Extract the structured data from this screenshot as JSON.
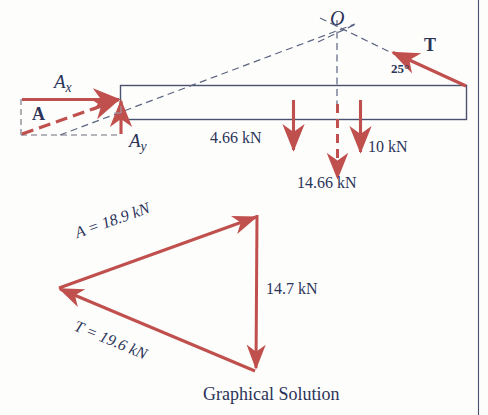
{
  "figure": {
    "caption": "Graphical Solution",
    "colors": {
      "force_red": "#c0504d",
      "ink_navy": "#2b3458",
      "beam_outline": "#4a5270",
      "construction_dash": "#5a6382",
      "page_rule": "#2b3458",
      "background": "#fdfdfc"
    }
  },
  "free_body_diagram": {
    "point_o_label": "O",
    "tension_label": "T",
    "tension_angle_label": "25°",
    "reaction_resultant_label": "A",
    "reaction_x_label": "A",
    "reaction_x_subscript": "x",
    "reaction_y_label": "A",
    "reaction_y_subscript": "y",
    "loads": [
      {
        "name": "load-left",
        "label": "4.66 kN",
        "value": 4.66,
        "unit": "kN",
        "style": "solid"
      },
      {
        "name": "load-resultant",
        "label": "14.66 kN",
        "value": 14.66,
        "unit": "kN",
        "style": "dashed"
      },
      {
        "name": "load-right",
        "label": "10 kN",
        "value": 10,
        "unit": "kN",
        "style": "solid"
      }
    ]
  },
  "force_triangle": {
    "side_a_label": "A = 18.9 kN",
    "side_t_label": "T = 19.6 kN",
    "side_vertical_label": "14.7 kN",
    "values": {
      "A": 18.9,
      "T": 19.6,
      "resultant_vertical": 14.7,
      "unit": "kN"
    }
  }
}
